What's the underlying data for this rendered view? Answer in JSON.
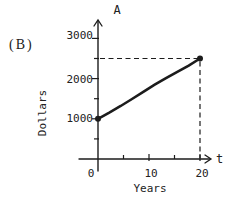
{
  "panel_label": "(B)",
  "chart_data": {
    "type": "line",
    "title": "",
    "x_axis": {
      "symbol": "t",
      "label": "Years",
      "ticks": [
        0,
        10,
        20
      ],
      "minor_ticks": [
        5,
        15
      ],
      "range": [
        0,
        22
      ]
    },
    "y_axis": {
      "symbol": "A",
      "label": "Dollars",
      "ticks": [
        1000,
        2000,
        3000
      ],
      "minor_ticks": [
        500,
        1500,
        2500
      ],
      "range": [
        0,
        3300
      ]
    },
    "series": [
      {
        "name": "amount-vs-time",
        "points": [
          [
            0,
            1000
          ],
          [
            20,
            2500
          ]
        ],
        "marker": "filled-dot",
        "style": "solid-hand-drawn"
      }
    ],
    "dashed_guides": [
      {
        "point": [
          20,
          2500
        ]
      }
    ],
    "grid": false,
    "ink_color": "#1c1c1c",
    "background_color": "#ffffff"
  }
}
